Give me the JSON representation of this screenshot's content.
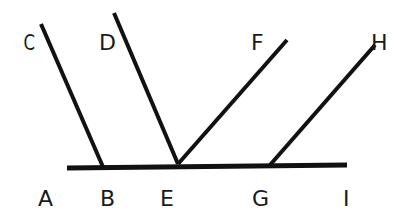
{
  "diagram": {
    "stroke_color": "#111111",
    "base_line": {
      "from": "A",
      "to": "I",
      "x1": 67,
      "y1": 167,
      "x2": 347,
      "y2": 165
    },
    "rays": [
      {
        "name": "BC",
        "x1": 103,
        "y1": 167,
        "x2": 41,
        "y2": 24
      },
      {
        "name": "ED",
        "x1": 178,
        "y1": 164,
        "x2": 114,
        "y2": 13
      },
      {
        "name": "EF",
        "x1": 178,
        "y1": 164,
        "x2": 287,
        "y2": 40
      },
      {
        "name": "GH",
        "x1": 270,
        "y1": 165,
        "x2": 375,
        "y2": 45
      }
    ],
    "labels": {
      "A": "A",
      "B": "B",
      "C": "C",
      "D": "D",
      "E": "E",
      "F": "F",
      "G": "G",
      "H": "H",
      "I": "I"
    }
  }
}
